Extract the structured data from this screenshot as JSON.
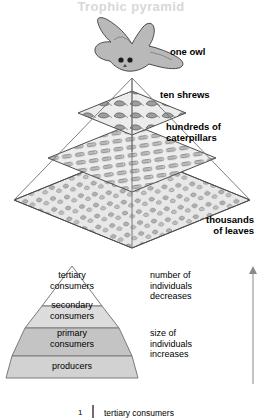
{
  "figure": {
    "watermark": "Trophic pyramid",
    "upper_diagram": {
      "name": "three-dimensional ecological pyramid of numbers",
      "callouts": [
        {
          "id": "owl",
          "text": "one owl"
        },
        {
          "id": "shrews",
          "text": "ten shrews"
        },
        {
          "id": "caterpillars",
          "text": "hundreds of\ncaterpillars"
        },
        {
          "id": "leaves",
          "text": "thousands\nof leaves"
        }
      ],
      "layers": [
        {
          "id": "owl-layer",
          "organism": "owl",
          "count_text": "one"
        },
        {
          "id": "shrew-layer",
          "organism": "shrews",
          "count_text": "ten"
        },
        {
          "id": "caterpillar-layer",
          "organism": "caterpillars",
          "count_text": "hundreds of"
        },
        {
          "id": "leaf-layer",
          "organism": "leaves",
          "count_text": "thousands of"
        }
      ]
    },
    "lower_diagram": {
      "name": "trophic level pyramid",
      "tiers": [
        {
          "id": "tertiary",
          "label": "tertiary\nconsumers",
          "fill": "#ffffff"
        },
        {
          "id": "secondary",
          "label": "secondary\nconsumers",
          "fill": "#dcdcdc"
        },
        {
          "id": "primary",
          "label": "primary\nconsumers",
          "fill": "#c4c4c4"
        },
        {
          "id": "producers",
          "label": "producers",
          "fill": "#d2d2d2"
        }
      ],
      "annotations": [
        {
          "id": "number-of-individuals",
          "text": "number of\nindividuals\ndecreases"
        },
        {
          "id": "size-of-individuals",
          "text": "size of\nindividuals\nincreases"
        }
      ],
      "axis": {
        "direction": "up",
        "stroke": "#8a8a8a"
      }
    },
    "footer": {
      "number": "1",
      "text": "tertiary consumers"
    },
    "colors": {
      "outline": "#555555",
      "pyramid_face_light": "#efefef",
      "pyramid_face_mid": "#e2e2e2",
      "text": "#000000",
      "watermark": "#d8d8d8"
    }
  }
}
